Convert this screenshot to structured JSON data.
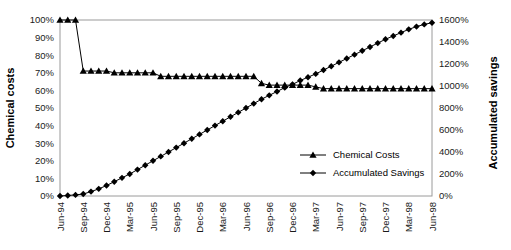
{
  "chart_data": {
    "type": "line",
    "title": "",
    "subtitle": "",
    "xlabel": "",
    "ylabel": "Chemical costs",
    "y2label": "Accumulated savings",
    "grid": false,
    "legend_position": "inside-right",
    "ylim": [
      0,
      100
    ],
    "y2lim": [
      0,
      1600
    ],
    "yticks": [
      "0%",
      "10%",
      "20%",
      "30%",
      "40%",
      "50%",
      "60%",
      "70%",
      "80%",
      "90%",
      "100%"
    ],
    "ytick_values": [
      0,
      10,
      20,
      30,
      40,
      50,
      60,
      70,
      80,
      90,
      100
    ],
    "y2ticks": [
      "0%",
      "200%",
      "400%",
      "600%",
      "800%",
      "1000%",
      "1200%",
      "1400%",
      "1600%"
    ],
    "y2tick_values": [
      0,
      200,
      400,
      600,
      800,
      1000,
      1200,
      1400,
      1600
    ],
    "xticks": [
      "Jun-94",
      "Sep-94",
      "Dec-94",
      "Mar-95",
      "Jun-95",
      "Sep-95",
      "Dec-95",
      "Mar-96",
      "Jun-96",
      "Sep-96",
      "Dec-96",
      "Mar-97",
      "Jun-97",
      "Sep-97",
      "Dec-97",
      "Mar-98",
      "Jun-98"
    ],
    "xtick_indices": [
      0,
      3,
      6,
      9,
      12,
      15,
      18,
      21,
      24,
      27,
      30,
      33,
      36,
      39,
      42,
      45,
      48
    ],
    "x": [
      "Jun-94",
      "Jul-94",
      "Aug-94",
      "Sep-94",
      "Oct-94",
      "Nov-94",
      "Dec-94",
      "Jan-95",
      "Feb-95",
      "Mar-95",
      "Apr-95",
      "May-95",
      "Jun-95",
      "Jul-95",
      "Aug-95",
      "Sep-95",
      "Oct-95",
      "Nov-95",
      "Dec-95",
      "Jan-96",
      "Feb-96",
      "Mar-96",
      "Apr-96",
      "May-96",
      "Jun-96",
      "Jul-96",
      "Aug-96",
      "Sep-96",
      "Oct-96",
      "Nov-96",
      "Dec-96",
      "Jan-97",
      "Feb-97",
      "Mar-97",
      "Apr-97",
      "May-97",
      "Jun-97",
      "Jul-97",
      "Aug-97",
      "Sep-97",
      "Oct-97",
      "Nov-97",
      "Dec-97",
      "Jan-98",
      "Feb-98",
      "Mar-98",
      "Apr-98",
      "May-98",
      "Jun-98"
    ],
    "series": [
      {
        "name": "Chemical Costs",
        "axis": "left",
        "marker": "triangle",
        "color": "#000000",
        "values": [
          100,
          100,
          100,
          71,
          71,
          71,
          71,
          70,
          70,
          70,
          70,
          70,
          70,
          68,
          68,
          68,
          68,
          68,
          68,
          68,
          68,
          68,
          68,
          68,
          68,
          68,
          64,
          63,
          63,
          63,
          63,
          63,
          63,
          62,
          61,
          61,
          61,
          61,
          61,
          61,
          61,
          61,
          61,
          61,
          61,
          61,
          61,
          61,
          61
        ]
      },
      {
        "name": "Accumulated Savings",
        "axis": "right",
        "marker": "diamond",
        "color": "#000000",
        "values": [
          0,
          5,
          10,
          18,
          40,
          65,
          95,
          130,
          165,
          200,
          240,
          280,
          320,
          360,
          400,
          440,
          480,
          520,
          560,
          600,
          640,
          680,
          720,
          760,
          800,
          840,
          880,
          915,
          950,
          985,
          1015,
          1050,
          1080,
          1110,
          1145,
          1180,
          1215,
          1250,
          1285,
          1320,
          1355,
          1390,
          1425,
          1455,
          1485,
          1515,
          1540,
          1560,
          1575
        ]
      }
    ],
    "legend_entries": [
      "Chemical Costs",
      "Accumulated Savings"
    ]
  },
  "layout": {
    "plot_left": 60,
    "plot_right": 432,
    "plot_top": 20,
    "plot_bottom": 196
  }
}
